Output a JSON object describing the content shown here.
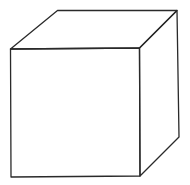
{
  "diagram": {
    "title": "",
    "shape": "cube",
    "style": {
      "stroke_color": "#2a2a2a",
      "background": "#ffffff"
    },
    "vertices": {
      "front_top_left": [
        10.5,
        49
      ],
      "front_top_right": [
        139.5,
        48
      ],
      "front_bottom_right": [
        140,
        176
      ],
      "front_bottom_left": [
        11,
        177
      ],
      "back_top_left": [
        57.5,
        10.5
      ],
      "back_top_right": [
        177,
        10.5
      ],
      "back_bottom_right": [
        179,
        137
      ]
    },
    "faces": [
      {
        "name": "front-face",
        "points": "10.5,49 139.5,48 140,176 11,177"
      },
      {
        "name": "top-face",
        "points": "10.5,49 57.5,10.5 177,10.5 139.5,48"
      },
      {
        "name": "right-face",
        "points": "139.5,48 177,10.5 179,137 140,176"
      }
    ]
  }
}
